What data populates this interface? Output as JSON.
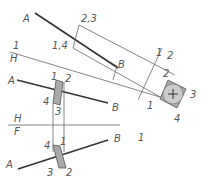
{
  "diagram": {
    "title": "",
    "colors": {
      "line": "#666666",
      "thick_line": "#333333",
      "fill_gray": "#aaaaaa",
      "circle_fill": "#cccccc",
      "text": "#555555",
      "background": "#ffffff"
    },
    "top_view": {
      "line_end_a": "A",
      "line_end_b": "B",
      "prism_corner_upper": "2,3",
      "prism_corner_lower": "1,4"
    },
    "reference_lines": {
      "ref_1_h_top": "1",
      "ref_1_h_bottom": "H",
      "ref_h_f_top": "H",
      "ref_h_f_bottom": "F",
      "ref_1_2_left": "1",
      "ref_1_2_right": "2",
      "ref_fold_label": "1"
    },
    "aux_view_2": {
      "corner_2": "2",
      "corner_3": "3",
      "corner_4": "4",
      "corner_1": "1",
      "b_label": "B"
    },
    "horizontal_view": {
      "line_end_a": "A",
      "line_end_b": "B",
      "corner_1": "1",
      "corner_2": "2",
      "corner_3": "3",
      "corner_4": "4"
    },
    "frontal_view": {
      "line_end_a": "A",
      "line_end_b": "B",
      "corner_1": "1",
      "corner_2": "2",
      "corner_3": "3",
      "corner_4": "4"
    }
  }
}
